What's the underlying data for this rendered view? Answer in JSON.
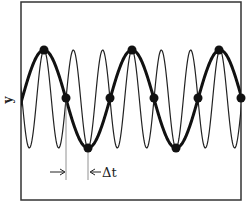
{
  "figure": {
    "y_axis_label": "y",
    "delta_t_label": "Δt",
    "colors": {
      "frame": "#333333",
      "thick_wave": "#111111",
      "thin_wave": "#222222",
      "dots": "#111111",
      "marker_lines": "#777777",
      "background": "#ffffff"
    }
  },
  "chart_data": {
    "type": "line",
    "title": "",
    "xlabel": "",
    "ylabel": "y",
    "grid": false,
    "legend": null,
    "frame_px": {
      "left": 21,
      "top": 2,
      "right": 241,
      "bottom": 200
    },
    "series": [
      {
        "name": "thick (low-frequency) sinusoid",
        "style": "thick",
        "stroke_width": 3,
        "center_y_px": 99,
        "amplitude_px": 49,
        "period_px": 88,
        "peak_phase_x_px": 44
      },
      {
        "name": "thin (high-frequency) sinusoid",
        "style": "thin",
        "stroke_width": 1.2,
        "center_y_px": 99,
        "amplitude_px": 49,
        "period_px": 29.333,
        "peak_phase_x_px": 44
      }
    ],
    "sample_points": [
      {
        "x": 44,
        "y": 50
      },
      {
        "x": 66,
        "y": 98
      },
      {
        "x": 88,
        "y": 148
      },
      {
        "x": 110,
        "y": 98
      },
      {
        "x": 132,
        "y": 50
      },
      {
        "x": 154,
        "y": 98
      },
      {
        "x": 176,
        "y": 148
      },
      {
        "x": 198,
        "y": 98
      },
      {
        "x": 219,
        "y": 50
      },
      {
        "x": 241,
        "y": 98
      }
    ],
    "annotations": [
      {
        "type": "interval",
        "label": "Δt",
        "x_start_px": 66,
        "x_end_px": 88,
        "arrow_y_px": 172
      }
    ]
  }
}
